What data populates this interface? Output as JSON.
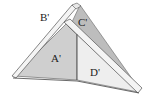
{
  "diagram": {
    "type": "folded-paper",
    "labels": {
      "a": "A'",
      "b": "B'",
      "c": "C'",
      "d": "D'"
    },
    "colors": {
      "face_a": "#cfcfcf",
      "face_c": "#bdbdbd",
      "face_d": "#eeeeee",
      "edge": "#555555",
      "strip": "#f4f4f4"
    }
  }
}
